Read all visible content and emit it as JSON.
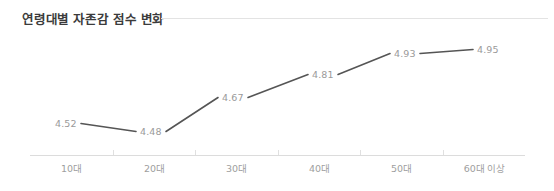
{
  "chart": {
    "title": "연령대별 자존감 점수 변화"
  },
  "chart_data": {
    "type": "line",
    "title": "연령대별 자존감 점수 변화",
    "xlabel": "",
    "ylabel": "",
    "categories": [
      "10대",
      "20대",
      "30대",
      "40대",
      "50대",
      "60대 이상"
    ],
    "values": [
      4.52,
      4.48,
      4.67,
      4.81,
      4.93,
      4.95
    ],
    "value_labels": [
      "4.52",
      "4.48",
      "4.67",
      "4.81",
      "4.93",
      "4.95"
    ],
    "ylim": [
      4.4,
      5.0
    ],
    "grid": false,
    "legend": null,
    "series": [
      {
        "name": "자존감 점수",
        "values": [
          4.52,
          4.48,
          4.67,
          4.81,
          4.93,
          4.95
        ]
      }
    ],
    "colors": {
      "line": "#555555",
      "label_text": "#9a9a9a",
      "axis": "#dcdcdc",
      "title_text": "#3b3b3b",
      "background": "#ffffff"
    }
  },
  "axis": {
    "categories": [
      {
        "label": "10대"
      },
      {
        "label": "20대"
      },
      {
        "label": "30대"
      },
      {
        "label": "40대"
      },
      {
        "label": "50대"
      },
      {
        "label": "60대 이상"
      }
    ]
  },
  "points": [
    {
      "label": "4.52",
      "x": 55,
      "y": 118
    },
    {
      "label": "4.48",
      "x": 140,
      "y": 126
    },
    {
      "label": "4.67",
      "x": 222,
      "y": 92
    },
    {
      "label": "4.81",
      "x": 312,
      "y": 69
    },
    {
      "label": "4.93",
      "x": 394,
      "y": 48
    },
    {
      "label": "4.95",
      "x": 477,
      "y": 44
    }
  ]
}
